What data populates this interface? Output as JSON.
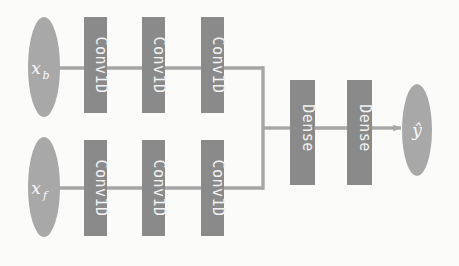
{
  "diagram": {
    "type": "flow-diagram",
    "background_color": "#fbfbfa",
    "colors": {
      "block_fill": "#8a8a8a",
      "ellipse_fill": "#a8a8a8",
      "edge": "#a6a6a6",
      "label_text": "#f2f2f2"
    },
    "inputs": [
      {
        "id": "input-xb",
        "label": "x",
        "subscript": "b",
        "shape": "ellipse",
        "branch": "top"
      },
      {
        "id": "input-xf",
        "label": "x",
        "subscript": "f",
        "shape": "ellipse",
        "branch": "bottom"
      }
    ],
    "branches": [
      {
        "name": "top",
        "source": "input-xb",
        "layers": [
          {
            "id": "conv-top-1",
            "label": "Conv1D",
            "shape": "rect"
          },
          {
            "id": "conv-top-2",
            "label": "Conv1D",
            "shape": "rect"
          },
          {
            "id": "conv-top-3",
            "label": "Conv1D",
            "shape": "rect"
          }
        ]
      },
      {
        "name": "bottom",
        "source": "input-xf",
        "layers": [
          {
            "id": "conv-bottom-1",
            "label": "Conv1D",
            "shape": "rect"
          },
          {
            "id": "conv-bottom-2",
            "label": "Conv1D",
            "shape": "rect"
          },
          {
            "id": "conv-bottom-3",
            "label": "Conv1D",
            "shape": "rect"
          }
        ]
      }
    ],
    "merge": {
      "id": "merge-junction",
      "label": "",
      "style": "bracket"
    },
    "head_layers": [
      {
        "id": "dense-1",
        "label": "Dense",
        "shape": "rect"
      },
      {
        "id": "dense-2",
        "label": "Dense",
        "shape": "rect"
      }
    ],
    "output": {
      "id": "output-yhat",
      "label": "ŷ",
      "shape": "ellipse",
      "arrow": true
    }
  }
}
